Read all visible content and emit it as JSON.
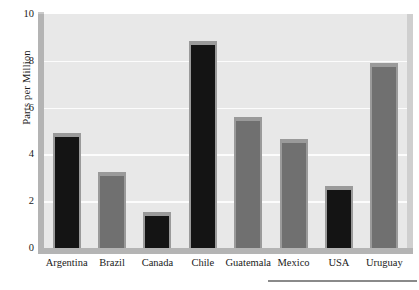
{
  "chart_data": {
    "type": "bar",
    "title": "",
    "subtitle": "",
    "xlabel": "",
    "ylabel": "Parts per Million",
    "ylim": [
      0,
      10
    ],
    "yticks": [
      0,
      2,
      4,
      6,
      8,
      10
    ],
    "grid": true,
    "legend": false,
    "legend_position": "none",
    "categories": [
      "Argentina",
      "Brazil",
      "Canada",
      "Chile",
      "Guatemala",
      "Mexico",
      "USA",
      "Uruguay"
    ],
    "values": [
      4.9,
      3.25,
      1.55,
      8.85,
      5.6,
      4.65,
      2.65,
      7.9
    ],
    "bar_colors": [
      "#141414",
      "#707070",
      "#141414",
      "#141414",
      "#707070",
      "#707070",
      "#141414",
      "#707070"
    ],
    "style": {
      "plot_background": "#e8e8e8",
      "gridline_color": "#fcfcfc",
      "wall_color": "#b4b4b4",
      "bar_cap_color": "#9a9a9a",
      "text_color": "#1a1a1a",
      "rule_color": "#8a8a8a"
    }
  },
  "axis": {
    "y_title": "Parts per Million",
    "y_tick_labels": [
      "10",
      "8",
      "6",
      "4",
      "2",
      "0"
    ],
    "x_tick_labels": [
      "Argentina",
      "Brazil",
      "Canada",
      "Chile",
      "Guatemala",
      "Mexico",
      "USA",
      "Uruguay"
    ]
  },
  "footer": {
    "rule_visible": true
  }
}
